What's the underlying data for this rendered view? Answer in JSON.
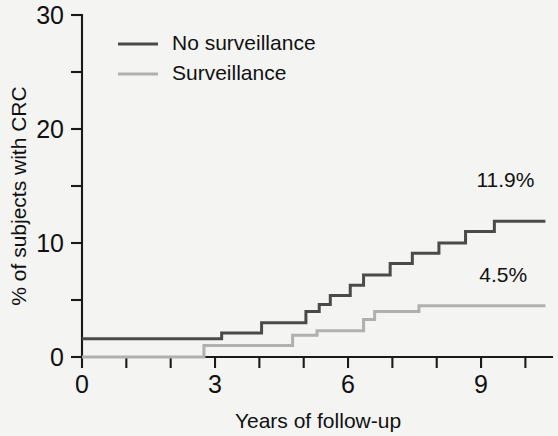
{
  "figure": {
    "background_color": "#f7f7f5",
    "plot_background_color": "#f4f4f2",
    "axis_color": "#1a1a1a"
  },
  "legend": {
    "position": "top-left",
    "entries": [
      {
        "label": "No surveillance",
        "color": "#4a4a4a",
        "series_key": "no_surveillance"
      },
      {
        "label": "Surveillance",
        "color": "#b0b0b0",
        "series_key": "surveillance"
      }
    ]
  },
  "annotations": [
    {
      "name": "no-surveillance-endpoint",
      "text": "11.9%",
      "x": 9.55,
      "y": 14.9,
      "color": "#111111"
    },
    {
      "name": "surveillance-endpoint",
      "text": "4.5%",
      "x": 9.5,
      "y": 6.6,
      "color": "#111111"
    }
  ],
  "chart_data": {
    "type": "line",
    "subtype": "step-cumulative-incidence",
    "title": "",
    "subtitle": "",
    "xlabel": "Years of follow-up",
    "ylabel": "% of subjects with CRC",
    "xlim": [
      0,
      10.6
    ],
    "ylim": [
      0,
      30
    ],
    "grid": false,
    "legend_position": "top-left",
    "x_ticks_major": [
      0,
      3,
      6,
      9
    ],
    "x_ticks_all": [
      0,
      1,
      2,
      3,
      4,
      5,
      6,
      7,
      8,
      9,
      10
    ],
    "x_tick_labels": [
      "0",
      "",
      "",
      "3",
      "",
      "",
      "6",
      "",
      "",
      "9",
      ""
    ],
    "y_ticks_major": [
      0,
      10,
      20,
      30
    ],
    "y_ticks_minor": [
      5,
      15,
      25
    ],
    "y_tick_labels": [
      "0",
      "10",
      "20",
      "30"
    ],
    "series": [
      {
        "name": "No surveillance",
        "color": "#4a4a4a",
        "final_value": 11.9,
        "final_label": "11.9%",
        "points": [
          [
            0.0,
            1.6
          ],
          [
            3.15,
            1.6
          ],
          [
            3.15,
            2.1
          ],
          [
            4.05,
            2.1
          ],
          [
            4.05,
            3.0
          ],
          [
            5.05,
            3.0
          ],
          [
            5.05,
            4.0
          ],
          [
            5.35,
            4.0
          ],
          [
            5.35,
            4.6
          ],
          [
            5.6,
            4.6
          ],
          [
            5.6,
            5.4
          ],
          [
            6.05,
            5.4
          ],
          [
            6.05,
            6.3
          ],
          [
            6.35,
            6.3
          ],
          [
            6.35,
            7.2
          ],
          [
            6.95,
            7.2
          ],
          [
            6.95,
            8.2
          ],
          [
            7.45,
            8.2
          ],
          [
            7.45,
            9.1
          ],
          [
            8.05,
            9.1
          ],
          [
            8.05,
            10.0
          ],
          [
            8.65,
            10.0
          ],
          [
            8.65,
            11.0
          ],
          [
            9.3,
            11.0
          ],
          [
            9.3,
            11.9
          ],
          [
            10.45,
            11.9
          ]
        ]
      },
      {
        "name": "Surveillance",
        "color": "#b0b0b0",
        "final_value": 4.5,
        "final_label": "4.5%",
        "points": [
          [
            0.0,
            0.0
          ],
          [
            2.75,
            0.0
          ],
          [
            2.75,
            1.0
          ],
          [
            4.75,
            1.0
          ],
          [
            4.75,
            1.9
          ],
          [
            5.3,
            1.9
          ],
          [
            5.3,
            2.3
          ],
          [
            6.35,
            2.3
          ],
          [
            6.35,
            3.3
          ],
          [
            6.6,
            3.3
          ],
          [
            6.6,
            4.0
          ],
          [
            7.6,
            4.0
          ],
          [
            7.6,
            4.5
          ],
          [
            10.45,
            4.5
          ]
        ]
      }
    ]
  }
}
